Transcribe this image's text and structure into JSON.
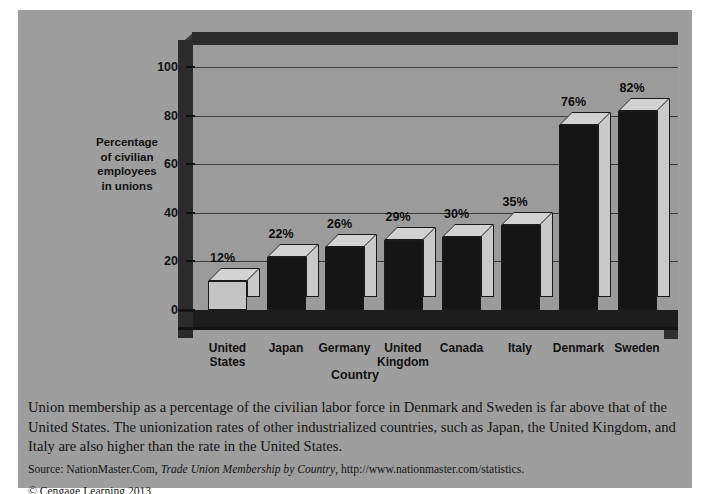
{
  "chart_data": {
    "type": "bar",
    "title": "",
    "xlabel": "Country",
    "ylabel": "Percentage of civilian employees in unions",
    "ylim": [
      0,
      110
    ],
    "yticks": [
      0,
      20,
      40,
      60,
      80,
      100
    ],
    "ytick_labels": [
      "0",
      "20",
      "40",
      "60",
      "80",
      "100"
    ],
    "grid": true,
    "legend": "none",
    "categories": [
      "United States",
      "Japan",
      "Germany",
      "United Kingdom",
      "Canada",
      "Italy",
      "Denmark",
      "Sweden"
    ],
    "values": [
      12,
      22,
      26,
      29,
      30,
      35,
      76,
      82
    ],
    "value_labels": [
      "12%",
      "22%",
      "26%",
      "29%",
      "30%",
      "35%",
      "76%",
      "82%"
    ],
    "bar_styles": [
      "light",
      "dark",
      "dark",
      "dark",
      "dark",
      "dark",
      "dark",
      "dark"
    ],
    "colors": {
      "panel_background": "#9e9e9e",
      "plot_background": "#9b9b9b",
      "frame_dark": "#2b2b2b",
      "bar_dark": "#151515",
      "bar_light": "#c4c4c4",
      "bar_top": "#d2d2d2",
      "gridline": "#3a3a3a",
      "text": "#111111"
    }
  },
  "axis": {
    "y_title_lines": [
      "Percentage",
      "of civilian",
      "employees",
      "in unions"
    ],
    "x_title": "Country"
  },
  "caption": {
    "body": "Union membership as a percentage of the civilian labor force in Denmark and Sweden is far above that of the United States. The unionization rates of other industrialized countries, such as Japan, the United Kingdom, and Italy are also higher than the rate in the United States.",
    "source_prefix": "Source: NationMaster.Com, ",
    "source_title": "Trade Union Membership by Country",
    "source_suffix": ", http://www.nationmaster.com/statistics.",
    "copyright": "© Cengage Learning 2013"
  }
}
